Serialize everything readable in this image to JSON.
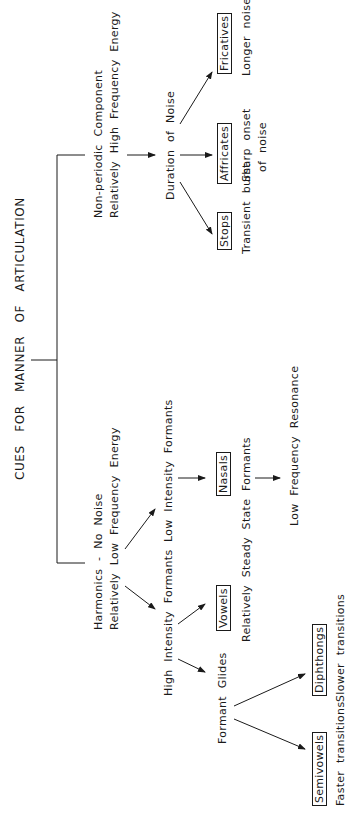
{
  "title": "CUES FOR MANNER OF ARTICULATION",
  "colors": {
    "ink": "#1a1a1a",
    "background": "#ffffff"
  },
  "branches": {
    "non_periodic": {
      "line1": "Non-periodic Component",
      "line2": "Relatively High Frequency Energy",
      "next": "Duration of Noise",
      "children": [
        {
          "category": "Stops",
          "cue_line1": "Transient burst",
          "cue_line2": ""
        },
        {
          "category": "Affricates",
          "cue_line1": "Sharp onset",
          "cue_line2": "of noise"
        },
        {
          "category": "Fricatives",
          "cue_line1": "Longer noise",
          "cue_line2": ""
        }
      ]
    },
    "harmonics": {
      "line1": "Harmonics - No Noise",
      "line2": "Relatively Low Frequency Energy",
      "high_intensity": {
        "label": "High Intensity Formants",
        "vowels": {
          "category": "Vowels",
          "cue": "Relatively Steady State Formants"
        },
        "formant_glides": {
          "label": "Formant Glides",
          "children": [
            {
              "category": "Semivowels",
              "cue": "Faster transitions"
            },
            {
              "category": "Diphthongs",
              "cue": "Slower transitions"
            }
          ]
        }
      },
      "low_intensity": {
        "label": "Low Intensity Formants",
        "nasals": {
          "category": "Nasals",
          "cue": "Low Frequency Resonance"
        }
      }
    }
  }
}
